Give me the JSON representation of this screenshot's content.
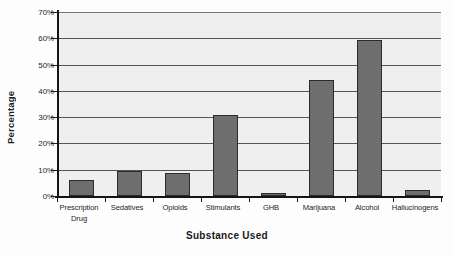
{
  "chart_data": {
    "type": "bar",
    "title": "",
    "xlabel": "Substance Used",
    "ylabel": "Percentage",
    "categories": [
      "Prescription Drug",
      "Sedatives",
      "Opioids",
      "Stimulants",
      "GHB",
      "Marijuana",
      "Alcohol",
      "Hallucinogens"
    ],
    "category_lines": [
      [
        "Prescription",
        "Drug"
      ],
      [
        "Sedatives"
      ],
      [
        "Opioids"
      ],
      [
        "Stimulants"
      ],
      [
        "GHB"
      ],
      [
        "Marijuana"
      ],
      [
        "Alcohol"
      ],
      [
        "Hallucinogens"
      ]
    ],
    "values": [
      6,
      9.7,
      8.8,
      31,
      1.3,
      44,
      59.5,
      2.2
    ],
    "ylim": [
      0,
      70
    ],
    "ytick_labels": [
      "0%",
      "10%",
      "20%",
      "30%",
      "40%",
      "50%",
      "60%",
      "70%"
    ],
    "ytick_values": [
      0,
      10,
      20,
      30,
      40,
      50,
      60,
      70
    ],
    "grid": true,
    "legend": "none",
    "bar_color": "#6e6e6e",
    "bar_border_color": "#2b2b2b",
    "plot_background": "#efefef",
    "axis_color": "#151515",
    "gridline_color": "#555555"
  },
  "watermark": {
    "text": "CHRONIC PAIN AND"
  }
}
